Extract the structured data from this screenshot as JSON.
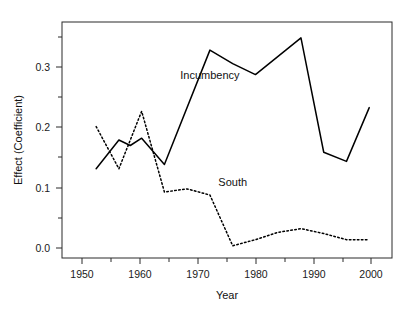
{
  "chart_data": {
    "type": "line",
    "title": "",
    "xlabel": "Year",
    "ylabel": "Effect (Coefficient)",
    "xlim": [
      1946,
      2004
    ],
    "ylim": [
      -0.018,
      0.368
    ],
    "grid": false,
    "legend": "inline-annotations",
    "x_ticks": [
      1950,
      1960,
      1970,
      1980,
      1990,
      2000
    ],
    "x_tick_labels": [
      "1950",
      "1960",
      "1970",
      "1980",
      "1990",
      "2000"
    ],
    "x_minor_ticks": [
      1955,
      1965,
      1975,
      1985,
      1995
    ],
    "y_ticks": [
      0.0,
      0.1,
      0.2,
      0.3
    ],
    "y_tick_labels": [
      "0.0",
      "0.1",
      "0.2",
      "0.3"
    ],
    "y_minor_ticks": [
      0.05,
      0.15,
      0.25,
      0.35
    ],
    "series": [
      {
        "name": "Incumbency",
        "style": "solid",
        "color": "#000000",
        "label_x": 1972,
        "label_y": 0.275,
        "x": [
          1952,
          1956,
          1958,
          1960,
          1964,
          1972,
          1976,
          1980,
          1988,
          1992,
          1996,
          2000
        ],
        "values": [
          0.128,
          0.175,
          0.166,
          0.178,
          0.135,
          0.322,
          0.3,
          0.282,
          0.342,
          0.155,
          0.14,
          0.228
        ]
      },
      {
        "name": "South",
        "style": "dotted",
        "color": "#000000",
        "label_x": 1976,
        "label_y": 0.1,
        "x": [
          1952,
          1956,
          1960,
          1964,
          1968,
          1972,
          1976,
          1980,
          1984,
          1988,
          1992,
          1996,
          2000
        ],
        "values": [
          0.197,
          0.128,
          0.222,
          0.09,
          0.095,
          0.085,
          0.002,
          0.012,
          0.024,
          0.03,
          0.022,
          0.012,
          0.012
        ]
      }
    ]
  },
  "axes": {
    "x_axis_title": "Year",
    "y_axis_title": "Effect (Coefficient)"
  },
  "annotations": {
    "incumbency": "Incumbency",
    "south": "South"
  }
}
